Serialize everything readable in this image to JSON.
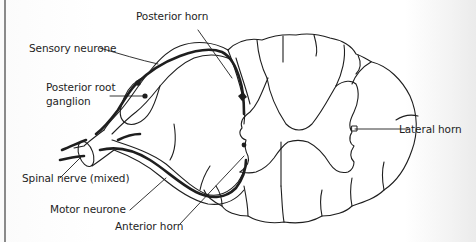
{
  "diagram": {
    "type": "anatomical-cross-section",
    "labels": {
      "posterior_horn": "Posterior horn",
      "sensory_neurone": "Sensory neurone",
      "posterior_root_ganglion_line1": "Posterior root",
      "posterior_root_ganglion_line2": "ganglion",
      "lateral_horn": "Lateral horn",
      "spinal_nerve": "Spinal nerve (mixed)",
      "motor_neurone": "Motor neurone",
      "anterior_horn": "Anterior horn"
    },
    "colors": {
      "ink": "#1e1e1e",
      "paper": "#ffffff"
    }
  }
}
